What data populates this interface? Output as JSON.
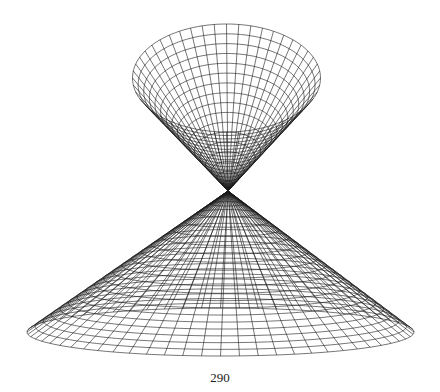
{
  "page": {
    "number": "290"
  },
  "figure": {
    "line_color": "#1a1a1a",
    "line_width": 0.6,
    "apex": [
      228,
      191
    ],
    "upper_nappe": {
      "rim_center": [
        226.5,
        78
      ],
      "rim_rx": 94,
      "rim_ry": 54,
      "parallels": 17,
      "meridians": 48
    },
    "lower_nappe": {
      "rim_center": [
        220.5,
        332
      ],
      "rim_rx": 193.5,
      "rim_ry": 24,
      "parallels": 20,
      "meridians": 64
    }
  }
}
